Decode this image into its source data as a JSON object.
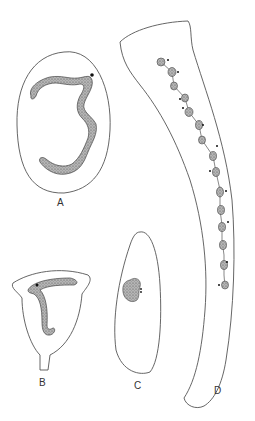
{
  "figure": {
    "panels": [
      {
        "id": "A",
        "label": "A",
        "description": "oval cell with long coiled nucleus"
      },
      {
        "id": "B",
        "label": "B",
        "description": "cup-shaped cell with hooked nucleus on stalk"
      },
      {
        "id": "C",
        "label": "C",
        "description": "elongated oval cell with small kidney-shaped nucleus"
      },
      {
        "id": "D",
        "label": "D",
        "description": "long trumpet-shaped cell with beaded macronucleus chain"
      }
    ],
    "colors": {
      "outline": "#555555",
      "nucleus_fill": "#9a9a9a",
      "nucleus_stroke": "#444444",
      "background": "#ffffff"
    }
  }
}
